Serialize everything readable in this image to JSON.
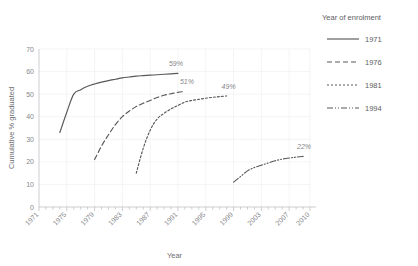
{
  "chart_data": {
    "type": "line",
    "title": "",
    "xlabel": "Year",
    "ylabel": "Cumulative % graduated",
    "xlim": [
      1971,
      2010
    ],
    "ylim": [
      0,
      70
    ],
    "y_ticks": [
      0,
      10,
      20,
      30,
      40,
      50,
      60,
      70
    ],
    "x_ticks": [
      1971,
      1975,
      1979,
      1983,
      1987,
      1991,
      1995,
      1999,
      2003,
      2007,
      2010
    ],
    "x_tick_labels": [
      "1971",
      "1975",
      "1979",
      "1983",
      "1987",
      "1991",
      "1995",
      "1999",
      "2003",
      "2007",
      "2010"
    ],
    "grid": "light vertical and horizontal gridlines",
    "legend_position": "right",
    "legend_title": "Year of enrolment",
    "series": [
      {
        "name": "1971",
        "style": "solid",
        "end_label": "59%",
        "x": [
          1974,
          1975,
          1976,
          1977,
          1978,
          1979,
          1980,
          1981,
          1982,
          1983,
          1984,
          1985,
          1986,
          1987,
          1988,
          1989,
          1990,
          1991
        ],
        "values": [
          33,
          42,
          50,
          52,
          53.5,
          54.5,
          55.3,
          56,
          56.6,
          57.2,
          57.6,
          58,
          58.2,
          58.4,
          58.6,
          58.8,
          59,
          59.2
        ]
      },
      {
        "name": "1976",
        "style": "dashed",
        "end_label": "51%",
        "x": [
          1979,
          1980,
          1981,
          1982,
          1983,
          1984,
          1985,
          1986,
          1987,
          1988,
          1989,
          1990,
          1991,
          1992
        ],
        "values": [
          21,
          27,
          32,
          36.5,
          40,
          42.5,
          44.5,
          46,
          47.2,
          48.5,
          49.5,
          50.2,
          50.8,
          51.2
        ]
      },
      {
        "name": "1981",
        "style": "dotted",
        "end_label": "49%",
        "x": [
          1985,
          1986,
          1987,
          1988,
          1989,
          1990,
          1991,
          1992,
          1993,
          1994,
          1995,
          1996,
          1997,
          1998
        ],
        "values": [
          15,
          26,
          34,
          39,
          41.5,
          43.5,
          45,
          46.5,
          47.2,
          47.7,
          48.2,
          48.6,
          48.9,
          49.2
        ]
      },
      {
        "name": "1994",
        "style": "dashdotdot",
        "end_label": "22%",
        "x": [
          1999,
          2000,
          2001,
          2002,
          2003,
          2004,
          2005,
          2006,
          2007,
          2008,
          2009
        ],
        "values": [
          11,
          13.5,
          16,
          17.5,
          18.5,
          19.5,
          20.5,
          21.2,
          21.7,
          22.1,
          22.4
        ]
      }
    ],
    "annotations": [
      {
        "text": "59%",
        "series": "1971"
      },
      {
        "text": "51%",
        "series": "1976"
      },
      {
        "text": "49%",
        "series": "1981"
      },
      {
        "text": "22%",
        "series": "1994"
      }
    ],
    "colors": {
      "line": "#58585c",
      "grid": "#ececee",
      "axis": "#b9b9bd",
      "text": "#87878b"
    }
  },
  "legend": {
    "title": "Year of enrolment",
    "items": [
      {
        "label": "1971",
        "style": "solid"
      },
      {
        "label": "1976",
        "style": "dashed"
      },
      {
        "label": "1981",
        "style": "dotted"
      },
      {
        "label": "1994",
        "style": "dashdotdot"
      }
    ]
  }
}
